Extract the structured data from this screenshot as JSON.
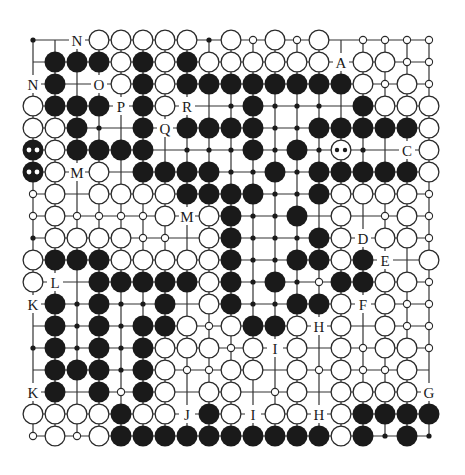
{
  "diagram": {
    "type": "go-board-diagram",
    "size": 19,
    "origin": {
      "x": 33,
      "y": 40
    },
    "spacing": 22,
    "stone_radius": 10.5,
    "colors": {
      "line": "#333333",
      "black_stone": "#1a1a1a",
      "white_stone_fill": "#ffffff",
      "white_stone_stroke": "#2a2a2a",
      "label": "#1a1a1a"
    },
    "legend": {
      "B": "black stone",
      "W": "white stone",
      "b": "black stone with two-dot mark",
      "w": "white stone with two-dot mark",
      "s": "small open circle marker",
      "d": "small black dot marker",
      ".": "empty intersection",
      "A-Z": "letter label"
    },
    "rows": [
      [
        "d",
        ".",
        "N",
        "W",
        "W",
        "W",
        "W",
        "W",
        "d",
        "W",
        "s",
        "W",
        "s",
        "W",
        ".",
        "s",
        "s",
        "s",
        "s"
      ],
      [
        ".",
        "B",
        "B",
        "B",
        "W",
        "B",
        "W",
        "B",
        "W",
        "W",
        "W",
        "W",
        "W",
        "W",
        "A",
        "W",
        "W",
        "s",
        "s"
      ],
      [
        "N",
        "B",
        ".",
        "O",
        "W",
        "B",
        "W",
        "B",
        "B",
        "B",
        "B",
        "B",
        "B",
        "B",
        "B",
        "W",
        "s",
        "W",
        "s"
      ],
      [
        "W",
        "B",
        "B",
        "B",
        "P",
        "B",
        "W",
        "R",
        ".",
        "d",
        "B",
        "d",
        "d",
        "d",
        ".",
        "B",
        "W",
        "W",
        "W"
      ],
      [
        "W",
        "W",
        "B",
        "d",
        ".",
        "B",
        "Q",
        "B",
        "B",
        "B",
        "B",
        "d",
        "d",
        "B",
        "B",
        "B",
        "B",
        "B",
        "W"
      ],
      [
        "b",
        "W",
        "B",
        "B",
        "B",
        "B",
        ".",
        "d",
        "d",
        "d",
        "B",
        "d",
        "B",
        "d",
        "w",
        "d",
        ".",
        "C",
        "W"
      ],
      [
        "b",
        "W",
        "M",
        "W",
        ".",
        "B",
        "B",
        "B",
        "B",
        "d",
        "d",
        "B",
        "d",
        "B",
        "B",
        "B",
        "B",
        "B",
        "W"
      ],
      [
        "s",
        "W",
        ".",
        "W",
        "W",
        "W",
        "W",
        "B",
        "B",
        "B",
        "B",
        "d",
        "d",
        "B",
        "W",
        "W",
        "W",
        "W",
        "s"
      ],
      [
        "s",
        "W",
        "s",
        "s",
        "s",
        "s",
        "W",
        "M",
        "W",
        "B",
        "d",
        "d",
        "B",
        ".",
        "W",
        ".",
        "s",
        "W",
        "s"
      ],
      [
        "d",
        "W",
        "W",
        "W",
        "W",
        "s",
        "s",
        ".",
        "W",
        "B",
        "d",
        "d",
        "d",
        "B",
        "W",
        "D",
        "W",
        "W",
        "s"
      ],
      [
        "W",
        "B",
        "B",
        "B",
        "W",
        "W",
        "W",
        "W",
        "W",
        "B",
        "d",
        "d",
        "B",
        "B",
        "W",
        "B",
        "E",
        ".",
        "W"
      ],
      [
        "W",
        "L",
        ".",
        "B",
        "B",
        "B",
        "B",
        "B",
        "W",
        "B",
        "d",
        "B",
        "d",
        "s",
        "B",
        "B",
        "W",
        "W",
        "s"
      ],
      [
        "K",
        "B",
        "d",
        "B",
        "d",
        "d",
        "B",
        ".",
        "W",
        "B",
        "d",
        "d",
        "B",
        "B",
        "W",
        "F",
        "W",
        "s",
        "s"
      ],
      [
        ".",
        "B",
        "d",
        "B",
        "d",
        "B",
        "B",
        "W",
        "s",
        "W",
        "B",
        "B",
        "W",
        "H",
        "W",
        ".",
        "W",
        "s",
        "s"
      ],
      [
        "d",
        "B",
        "d",
        "B",
        "d",
        "B",
        "W",
        "W",
        "W",
        "s",
        "W",
        "I",
        "W",
        ".",
        "W",
        "s",
        "W",
        "W",
        "s"
      ],
      [
        ".",
        "B",
        "B",
        "B",
        "d",
        "B",
        "W",
        "s",
        "s",
        "W",
        "W",
        ".",
        "W",
        "s",
        "W",
        "s",
        "s",
        "W",
        "."
      ],
      [
        "K",
        "B",
        ".",
        "B",
        "s",
        "B",
        "W",
        ".",
        "W",
        "W",
        ".",
        "s",
        "W",
        ".",
        "W",
        "W",
        "W",
        "W",
        "G"
      ],
      [
        "W",
        "W",
        "W",
        "W",
        "B",
        "W",
        "W",
        "J",
        "B",
        "W",
        "I",
        "W",
        "W",
        "H",
        "W",
        "B",
        "B",
        "B",
        "B"
      ],
      [
        "s",
        "W",
        "s",
        "W",
        "B",
        "B",
        "B",
        "B",
        "B",
        "B",
        "B",
        "B",
        "B",
        "B",
        "W",
        "B",
        "d",
        "B",
        "d"
      ]
    ],
    "labels_present": [
      "A",
      "B",
      "C",
      "D",
      "E",
      "F",
      "G",
      "H",
      "I",
      "J",
      "K",
      "L",
      "M",
      "N",
      "O",
      "P",
      "Q",
      "R"
    ]
  }
}
